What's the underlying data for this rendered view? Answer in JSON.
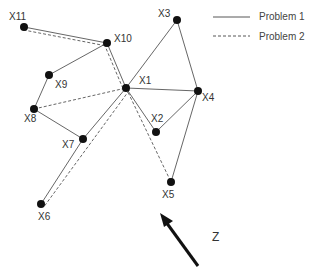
{
  "legend": {
    "items": [
      {
        "label": "Problem 1",
        "style": "solid"
      },
      {
        "label": "Problem 2",
        "style": "dashed"
      }
    ]
  },
  "direction": {
    "label": "Z"
  },
  "nodes": [
    {
      "id": "X1",
      "x": 126,
      "y": 88,
      "lx": 139,
      "ly": 84
    },
    {
      "id": "X2",
      "x": 156,
      "y": 132,
      "lx": 151,
      "ly": 122
    },
    {
      "id": "X3",
      "x": 177,
      "y": 20,
      "lx": 158,
      "ly": 17
    },
    {
      "id": "X4",
      "x": 198,
      "y": 91,
      "lx": 202,
      "ly": 101
    },
    {
      "id": "X5",
      "x": 171,
      "y": 182,
      "lx": 162,
      "ly": 198
    },
    {
      "id": "X6",
      "x": 41,
      "y": 204,
      "lx": 38,
      "ly": 220
    },
    {
      "id": "X7",
      "x": 83,
      "y": 139,
      "lx": 62,
      "ly": 148
    },
    {
      "id": "X8",
      "x": 34,
      "y": 109,
      "lx": 24,
      "ly": 122
    },
    {
      "id": "X9",
      "x": 49,
      "y": 75,
      "lx": 55,
      "ly": 88
    },
    {
      "id": "X10",
      "x": 107,
      "y": 43,
      "lx": 114,
      "ly": 42
    },
    {
      "id": "X11",
      "x": 24,
      "y": 27,
      "lx": 9,
      "ly": 20
    }
  ],
  "solid_edges": [
    [
      "X11",
      "X10"
    ],
    [
      "X10",
      "X9"
    ],
    [
      "X9",
      "X8"
    ],
    [
      "X8",
      "X7"
    ],
    [
      "X7",
      "X1"
    ],
    [
      "X10",
      "X1"
    ],
    [
      "X1",
      "X3"
    ],
    [
      "X3",
      "X4"
    ],
    [
      "X1",
      "X4"
    ],
    [
      "X1",
      "X2"
    ],
    [
      "X2",
      "X4"
    ],
    [
      "X4",
      "X5"
    ],
    [
      "X7",
      "X6"
    ]
  ],
  "dashed_edges": [
    [
      "X11",
      "X10"
    ],
    [
      "X10",
      "X1"
    ],
    [
      "X8",
      "X1"
    ],
    [
      "X1",
      "X6"
    ],
    [
      "X1",
      "X5"
    ]
  ]
}
